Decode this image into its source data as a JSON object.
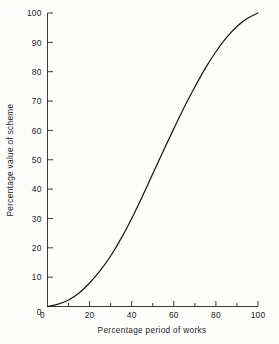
{
  "chart_data": {
    "type": "line",
    "title": "",
    "subtitle": "",
    "xlabel": "Percentage period of works",
    "ylabel": "Percentage value of scheme",
    "xlim": [
      0,
      100
    ],
    "ylim": [
      0,
      100
    ],
    "grid": false,
    "legend": null,
    "legend_position": "none",
    "x_ticks_major": [
      0,
      20,
      40,
      60,
      80,
      100
    ],
    "x_tick_labels": [
      "0",
      "20",
      "40",
      "60",
      "80",
      "100"
    ],
    "x_ticks_minor": [
      10,
      30,
      50,
      70,
      90
    ],
    "y_ticks_major": [
      0,
      10,
      20,
      30,
      40,
      50,
      60,
      70,
      80,
      90,
      100
    ],
    "y_tick_labels": [
      "0",
      "10",
      "20",
      "30",
      "40",
      "50",
      "60",
      "70",
      "80",
      "90",
      "100"
    ],
    "series": [
      {
        "name": "S-curve",
        "color": "#1a1a1a",
        "x": [
          0,
          5,
          10,
          15,
          20,
          25,
          30,
          35,
          40,
          45,
          50,
          55,
          60,
          65,
          70,
          75,
          80,
          85,
          90,
          95,
          100
        ],
        "values": [
          0,
          0.8,
          2.2,
          4.6,
          8.0,
          12.2,
          17.2,
          23.2,
          30.0,
          37.4,
          45.2,
          53.0,
          60.6,
          68.0,
          74.8,
          81.2,
          86.8,
          91.6,
          95.4,
          98.2,
          100.0
        ]
      }
    ],
    "annotations": []
  },
  "axes": {
    "x_axis_name": "Percentage period of works",
    "y_axis_name": "Percentage value of scheme"
  },
  "style": {
    "line_color": "#1a1a1a",
    "axis_color": "#3a3a3a",
    "background_color": "#fdfdfc",
    "text_color": "#222222"
  }
}
